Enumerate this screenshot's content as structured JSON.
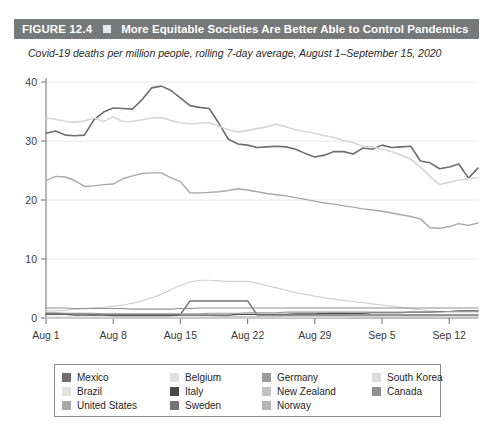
{
  "figure": {
    "number_label": "FIGURE 12.4",
    "marker_icon": "square-bullet-icon",
    "title": "More Equitable Societies Are Better Able to Control Pandemics",
    "subtitle": "Covid-19 deaths per million people, rolling 7-day average, August 1–September 15, 2020",
    "header_bg": "#76787a",
    "header_text_color": "#ffffff"
  },
  "chart_data": {
    "type": "line",
    "title": "More Equitable Societies Are Better Able to Control Pandemics",
    "subtitle": "Covid-19 deaths per million people, rolling 7-day average, August 1–September 15, 2020",
    "xlabel": "",
    "ylabel": "",
    "ylim": [
      0,
      40
    ],
    "yticks": [
      0,
      10,
      20,
      30,
      40
    ],
    "ytick_labels": [
      "0",
      "10",
      "20",
      "30",
      "40"
    ],
    "xlim": [
      0,
      45
    ],
    "xticks": [
      0,
      7,
      14,
      21,
      28,
      35,
      42
    ],
    "xtick_labels": [
      "Aug 1",
      "Aug 8",
      "Aug 15",
      "Aug 22",
      "Aug 29",
      "Sep 5",
      "Sep 12"
    ],
    "grid": true,
    "grid_color": "#eceaea",
    "legend_position": "bottom",
    "x": [
      0,
      1,
      2,
      3,
      4,
      5,
      6,
      7,
      8,
      9,
      10,
      11,
      12,
      13,
      14,
      15,
      16,
      17,
      18,
      19,
      20,
      21,
      22,
      23,
      24,
      25,
      26,
      27,
      28,
      29,
      30,
      31,
      32,
      33,
      34,
      35,
      36,
      37,
      38,
      39,
      40,
      41,
      42,
      43,
      44,
      45
    ],
    "series": [
      {
        "name": "Mexico",
        "color": "#6e6e6e",
        "width": 1.6,
        "values": [
          31.3,
          31.7,
          31.0,
          30.9,
          31.0,
          33.6,
          34.9,
          35.6,
          35.5,
          35.4,
          37.0,
          39.0,
          39.3,
          38.6,
          37.3,
          36.0,
          35.7,
          35.5,
          33.0,
          30.3,
          29.5,
          29.3,
          28.9,
          29.0,
          29.1,
          29.0,
          28.6,
          27.9,
          27.3,
          27.6,
          28.2,
          28.2,
          27.8,
          28.8,
          28.6,
          29.3,
          28.9,
          29.0,
          29.1,
          26.6,
          26.3,
          25.3,
          25.6,
          26.1,
          23.7,
          25.4
        ]
      },
      {
        "name": "Brazil",
        "color": "#d6d6d6",
        "width": 1.6,
        "values": [
          33.9,
          33.7,
          33.3,
          33.2,
          33.4,
          33.9,
          33.3,
          34.1,
          33.3,
          33.3,
          33.6,
          33.9,
          34.0,
          33.5,
          33.1,
          32.9,
          33.0,
          33.1,
          32.5,
          31.9,
          31.5,
          31.8,
          32.1,
          32.4,
          32.9,
          32.4,
          31.9,
          31.6,
          31.3,
          30.9,
          30.6,
          30.1,
          29.7,
          29.1,
          29.0,
          28.6,
          28.2,
          27.6,
          26.9,
          25.6,
          24.0,
          22.6,
          23.0,
          23.4,
          23.6,
          23.8
        ]
      },
      {
        "name": "United States",
        "color": "#a8a8a8",
        "width": 1.4,
        "values": [
          23.3,
          24.0,
          23.9,
          23.3,
          22.3,
          22.4,
          22.6,
          22.7,
          23.6,
          24.1,
          24.5,
          24.6,
          24.6,
          23.8,
          23.1,
          21.2,
          21.2,
          21.3,
          21.4,
          21.6,
          21.9,
          21.7,
          21.4,
          21.1,
          20.9,
          20.7,
          20.4,
          20.1,
          19.8,
          19.5,
          19.3,
          19.0,
          18.8,
          18.5,
          18.3,
          18.1,
          17.8,
          17.5,
          17.2,
          16.8,
          15.3,
          15.2,
          15.5,
          16.0,
          15.7,
          16.1
        ]
      },
      {
        "name": "Belgium",
        "color": "#d0d0d0",
        "width": 1.2,
        "values": [
          1.2,
          1.2,
          1.3,
          1.5,
          1.6,
          1.7,
          1.8,
          2.0,
          2.2,
          2.5,
          2.9,
          3.4,
          4.0,
          4.8,
          5.5,
          6.1,
          6.4,
          6.4,
          6.3,
          6.2,
          6.2,
          6.2,
          5.9,
          5.5,
          5.1,
          4.7,
          4.3,
          4.0,
          3.7,
          3.4,
          3.2,
          3.0,
          2.8,
          2.6,
          2.4,
          2.2,
          2.0,
          1.8,
          1.6,
          1.4,
          1.2,
          1.1,
          1.0,
          1.0,
          1.0,
          1.0
        ]
      },
      {
        "name": "Italy",
        "color": "#4a4a4a",
        "width": 1.2,
        "values": [
          0.6,
          0.6,
          0.6,
          0.5,
          0.5,
          0.5,
          0.5,
          0.4,
          0.4,
          0.4,
          0.4,
          0.4,
          0.4,
          0.4,
          0.5,
          0.5,
          0.5,
          0.5,
          0.5,
          0.5,
          0.6,
          0.6,
          0.6,
          0.6,
          0.6,
          0.6,
          0.7,
          0.7,
          0.7,
          0.8,
          0.8,
          0.8,
          0.8,
          0.8,
          0.9,
          0.9,
          0.9,
          0.9,
          1.0,
          1.0,
          1.0,
          1.1,
          1.1,
          1.2,
          1.2,
          1.2
        ]
      },
      {
        "name": "Sweden",
        "color": "#737373",
        "width": 1.5,
        "values": [
          0.7,
          0.7,
          0.7,
          0.7,
          0.7,
          0.6,
          0.6,
          0.6,
          0.6,
          0.6,
          0.6,
          0.6,
          0.6,
          0.6,
          0.6,
          2.9,
          2.9,
          2.9,
          2.9,
          2.9,
          2.9,
          2.9,
          0.5,
          0.5,
          0.5,
          0.5,
          0.5,
          0.5,
          0.5,
          0.5,
          0.5,
          0.5,
          0.5,
          0.5,
          0.5,
          0.5,
          0.5,
          0.5,
          0.5,
          0.5,
          0.5,
          0.5,
          0.5,
          0.5,
          0.5,
          0.5
        ]
      },
      {
        "name": "Germany",
        "color": "#9b9b9b",
        "width": 1.1,
        "values": [
          0.9,
          0.9,
          0.8,
          0.8,
          0.8,
          0.8,
          0.7,
          0.7,
          0.7,
          0.7,
          0.7,
          0.7,
          0.7,
          0.7,
          0.7,
          0.7,
          0.7,
          0.8,
          0.8,
          0.8,
          0.8,
          0.9,
          0.9,
          0.9,
          0.9,
          1.0,
          1.0,
          1.0,
          1.0,
          1.0,
          1.0,
          1.0,
          1.0,
          1.0,
          1.0,
          1.0,
          1.0,
          1.0,
          1.0,
          1.0,
          1.0,
          1.0,
          1.1,
          1.1,
          1.1,
          1.1
        ]
      },
      {
        "name": "New Zealand",
        "color": "#c2c2c2",
        "width": 1.1,
        "values": [
          0.0,
          0.0,
          0.0,
          0.0,
          0.0,
          0.0,
          0.0,
          0.0,
          0.0,
          0.0,
          0.0,
          0.0,
          0.0,
          0.0,
          0.0,
          0.0,
          0.0,
          0.0,
          0.0,
          0.0,
          0.0,
          0.0,
          0.0,
          0.0,
          0.1,
          0.1,
          0.1,
          0.1,
          0.1,
          0.1,
          0.1,
          0.1,
          0.1,
          0.1,
          0.1,
          0.1,
          0.1,
          0.1,
          0.1,
          0.1,
          0.1,
          0.1,
          0.1,
          0.1,
          0.1,
          0.1
        ]
      },
      {
        "name": "Norway",
        "color": "#b5b5b5",
        "width": 1.1,
        "values": [
          0.1,
          0.1,
          0.1,
          0.1,
          0.1,
          0.1,
          0.1,
          0.1,
          0.1,
          0.1,
          0.1,
          0.1,
          0.1,
          0.1,
          0.1,
          0.1,
          0.1,
          0.1,
          0.2,
          0.2,
          0.2,
          0.2,
          0.2,
          0.2,
          0.2,
          0.2,
          0.2,
          0.2,
          0.2,
          0.2,
          0.2,
          0.2,
          0.2,
          0.2,
          0.2,
          0.2,
          0.2,
          0.2,
          0.2,
          0.2,
          0.2,
          0.2,
          0.2,
          0.2,
          0.2,
          0.2
        ]
      },
      {
        "name": "South Korea",
        "color": "#dcdcdc",
        "width": 1.1,
        "values": [
          0.0,
          0.0,
          0.0,
          0.0,
          0.0,
          0.0,
          0.0,
          0.0,
          0.0,
          0.0,
          0.0,
          0.0,
          0.0,
          0.0,
          0.0,
          0.0,
          0.0,
          0.0,
          0.0,
          0.0,
          0.0,
          0.0,
          0.0,
          0.0,
          0.0,
          0.1,
          0.1,
          0.1,
          0.1,
          0.1,
          0.1,
          0.1,
          0.2,
          0.2,
          0.2,
          0.2,
          0.2,
          0.2,
          0.2,
          0.2,
          0.2,
          0.2,
          0.2,
          0.2,
          0.2,
          0.2
        ]
      },
      {
        "name": "Canada",
        "color": "#8f8f8f",
        "width": 1.1,
        "values": [
          1.7,
          1.7,
          1.7,
          1.6,
          1.6,
          1.6,
          1.6,
          1.6,
          1.6,
          1.5,
          1.5,
          1.5,
          1.5,
          1.5,
          1.6,
          1.6,
          1.7,
          1.7,
          1.7,
          1.7,
          1.7,
          1.7,
          1.7,
          1.7,
          1.7,
          1.7,
          1.7,
          1.7,
          1.7,
          1.7,
          1.7,
          1.7,
          1.7,
          1.7,
          1.7,
          1.7,
          1.7,
          1.7,
          1.7,
          1.7,
          1.7,
          1.7,
          1.7,
          1.7,
          1.7,
          1.7
        ]
      }
    ]
  },
  "legend": {
    "columns": [
      [
        {
          "label": "Mexico",
          "color": "#6e6e6e"
        },
        {
          "label": "Brazil",
          "color": "#e2e2e2"
        },
        {
          "label": "United States",
          "color": "#a8a8a8"
        }
      ],
      [
        {
          "label": "Belgium",
          "color": "#e0e0e0"
        },
        {
          "label": "Italy",
          "color": "#4a4a4a"
        },
        {
          "label": "Sweden",
          "color": "#737373"
        }
      ],
      [
        {
          "label": "Germany",
          "color": "#9b9b9b"
        },
        {
          "label": "New Zealand",
          "color": "#c2c2c2"
        },
        {
          "label": "Norway",
          "color": "#b5b5b5"
        }
      ],
      [
        {
          "label": "South Korea",
          "color": "#dcdcdc"
        },
        {
          "label": "Canada",
          "color": "#8f8f8f"
        }
      ]
    ]
  }
}
